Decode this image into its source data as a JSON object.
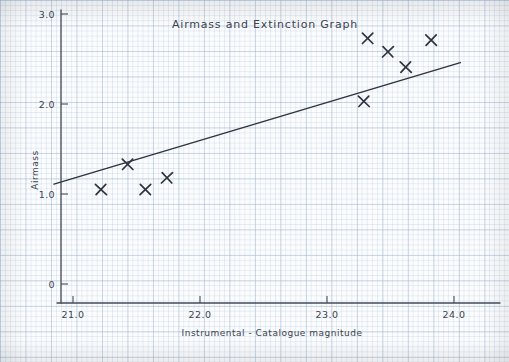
{
  "chart_data": {
    "type": "scatter",
    "title": "Airmass and Extinction Graph",
    "xlabel": "Instrumental - Catalogue magnitude",
    "ylabel": "Airmass",
    "xlim": [
      20.77,
      24.28
    ],
    "ylim": [
      -0.21,
      3.12
    ],
    "grid": true,
    "grid_style": "graph-paper",
    "legend": null,
    "xticks": [
      21.0,
      22.0,
      23.0,
      24.0
    ],
    "xtick_labels": [
      "21.0",
      "22.0",
      "23.0",
      "24.0"
    ],
    "yticks": [
      0,
      1.0,
      2.0,
      3.0
    ],
    "ytick_labels": [
      "0",
      "1.0",
      "2.0",
      "3.0"
    ],
    "marker": "x",
    "marker_color": "#2e3440",
    "line_color": "#2e3440",
    "points": [
      {
        "x": 21.22,
        "y": 1.05
      },
      {
        "x": 21.43,
        "y": 1.33
      },
      {
        "x": 21.57,
        "y": 1.05
      },
      {
        "x": 21.74,
        "y": 1.18
      },
      {
        "x": 23.29,
        "y": 2.03
      },
      {
        "x": 23.32,
        "y": 2.73
      },
      {
        "x": 23.48,
        "y": 2.58
      },
      {
        "x": 23.62,
        "y": 2.41
      },
      {
        "x": 23.82,
        "y": 2.71
      }
    ],
    "trendline": {
      "label": "best fit line",
      "x_start": 20.85,
      "y_start": 1.11,
      "x_end": 24.05,
      "y_end": 2.46,
      "slope": 0.42,
      "intercept": -7.69
    }
  }
}
